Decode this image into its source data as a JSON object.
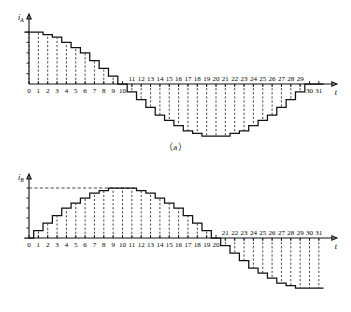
{
  "figure": {
    "panels": [
      {
        "id": "a",
        "caption": "（a）",
        "y_axis_label": "i",
        "y_axis_subscript": "A",
        "x_axis_label": "t"
      },
      {
        "id": "b",
        "caption": "（b）",
        "y_axis_label": "i",
        "y_axis_subscript": "B",
        "x_axis_label": "t"
      }
    ]
  },
  "chart_data": [
    {
      "type": "bar",
      "id": "panel-a",
      "title": "",
      "subtitle": "",
      "xlabel": "t",
      "ylabel": "iA",
      "waveform": "stepped cosine (starts at positive maximum)",
      "categories": [
        "0",
        "1",
        "2",
        "3",
        "4",
        "5",
        "6",
        "7",
        "8",
        "9",
        "10",
        "11",
        "12",
        "13",
        "14",
        "15",
        "16",
        "17",
        "18",
        "19",
        "20",
        "21",
        "22",
        "23",
        "24",
        "25",
        "26",
        "27",
        "28",
        "29",
        "30",
        "31"
      ],
      "values": [
        10,
        10,
        9.5,
        9,
        8,
        7,
        6,
        4.5,
        3,
        1.5,
        0,
        -1.5,
        -3,
        -4.5,
        -6,
        -7,
        -8,
        -9,
        -9.5,
        -10,
        -10,
        -10,
        -9.5,
        -9,
        -8,
        -7,
        -6,
        -4.5,
        -3,
        -1.5,
        0,
        0
      ],
      "xlim": [
        0,
        31
      ],
      "ylim": [
        -10,
        10
      ],
      "grid": false,
      "legend": "none",
      "tick_labels_positive_side": [
        "0",
        "1",
        "2",
        "3",
        "4",
        "5",
        "6",
        "7",
        "8",
        "9",
        "10"
      ],
      "tick_labels_negative_side": [
        "11",
        "12",
        "13",
        "14",
        "15",
        "16",
        "17",
        "18",
        "19",
        "20",
        "21",
        "22",
        "23",
        "24",
        "25",
        "26",
        "27",
        "28",
        "29",
        "30",
        "31"
      ],
      "dashed_vertical_drops": true,
      "dashed_reference_line": false
    },
    {
      "type": "bar",
      "id": "panel-b",
      "title": "",
      "subtitle": "",
      "xlabel": "t",
      "ylabel": "iB",
      "waveform": "stepped sine (starts at zero, peaks near t=10-11)",
      "categories": [
        "0",
        "1",
        "2",
        "3",
        "4",
        "5",
        "6",
        "7",
        "8",
        "9",
        "10",
        "11",
        "12",
        "13",
        "14",
        "15",
        "16",
        "17",
        "18",
        "19",
        "20",
        "21",
        "22",
        "23",
        "24",
        "25",
        "26",
        "27",
        "28",
        "29",
        "30",
        "31"
      ],
      "values": [
        0,
        1.5,
        3,
        4.5,
        6,
        7,
        8,
        9,
        9.5,
        10,
        10,
        10,
        9.5,
        9,
        8,
        7,
        6,
        4.5,
        3,
        1.5,
        0,
        -1.5,
        -3,
        -4.5,
        -6,
        -7,
        -8,
        -9,
        -9.5,
        -10,
        -10,
        -10
      ],
      "xlim": [
        0,
        31
      ],
      "ylim": [
        -10,
        10
      ],
      "grid": false,
      "legend": "none",
      "tick_labels_positive_side": [
        "0",
        "1",
        "2",
        "3",
        "4",
        "5",
        "6",
        "7",
        "8",
        "9",
        "10",
        "11",
        "12",
        "13",
        "14",
        "15",
        "16",
        "17",
        "18",
        "19",
        "20"
      ],
      "tick_labels_negative_side": [
        "21",
        "22",
        "23",
        "24",
        "25",
        "26",
        "27",
        "28",
        "29",
        "30",
        "31"
      ],
      "dashed_vertical_drops": true,
      "dashed_reference_line": true
    }
  ]
}
